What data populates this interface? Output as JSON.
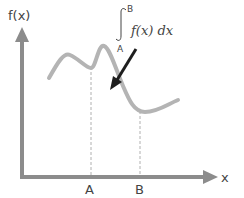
{
  "diagram": {
    "y_axis_label": "f(x)",
    "x_axis_label": "x",
    "point_a_label": "A",
    "point_b_label": "B",
    "integral": {
      "upper_limit": "B",
      "lower_limit": "A",
      "integrand": "f(x) dx"
    },
    "colors": {
      "axis": "#8c8c8c",
      "curve": "#b4b4b4",
      "arrow": "#1e1e1e",
      "dashed": "#b0b0b0",
      "text": "#444444"
    }
  }
}
